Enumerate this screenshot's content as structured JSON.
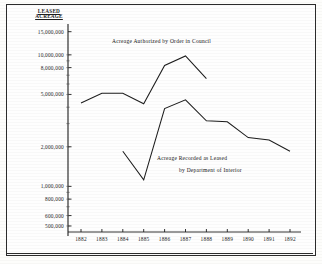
{
  "figure": {
    "background_color": "#fdfdfb",
    "ink_color": "#1d1d1d",
    "y_axis_title_line1": "LEASED",
    "y_axis_title_line2": "ACREAGE"
  },
  "annotations": {
    "series1_label": "Acreage Authorized by Order in Council",
    "series2_label_line1": "Acreage Recorded as Leased",
    "series2_label_line2": "by Department of Interior"
  },
  "chart_data": {
    "type": "line",
    "title": "",
    "subtitle": "",
    "xlabel": "",
    "ylabel": "LEASED ACREAGE",
    "yscale": "log",
    "ylim": [
      450000,
      16000000
    ],
    "grid": false,
    "legend_position": "inline-annotation",
    "categories": [
      "1882",
      "1883",
      "1884",
      "1885",
      "1886",
      "1887",
      "1888",
      "1889",
      "1890",
      "1891",
      "1892"
    ],
    "x": [
      1882,
      1883,
      1884,
      1885,
      1886,
      1887,
      1888,
      1889,
      1890,
      1891,
      1892
    ],
    "ytick_labels": [
      "15,000,000",
      "10,000,000",
      "8,000,000",
      "5,000,000",
      "2,000,000",
      "1,000,000",
      "800,000",
      "600,000",
      "500,000"
    ],
    "ytick_values": [
      15000000,
      10000000,
      8000000,
      5000000,
      2000000,
      1000000,
      800000,
      600000,
      500000
    ],
    "xtick_labels": [
      "1882",
      "1883",
      "1884",
      "1885",
      "1886",
      "1887",
      "1888",
      "1889",
      "1890",
      "1891",
      "1892"
    ],
    "series": [
      {
        "name": "Acreage Authorized by Order in Council",
        "x": [
          1882,
          1883,
          1884,
          1885,
          1886,
          1887,
          1888
        ],
        "values": [
          4300000,
          5100000,
          5100000,
          4250000,
          8300000,
          9800000,
          6600000
        ]
      },
      {
        "name": "Acreage Recorded as Leased by Department of Interior",
        "x": [
          1884,
          1885,
          1886,
          1887,
          1888,
          1889,
          1890,
          1891,
          1892
        ],
        "values": [
          1850000,
          1120000,
          3900000,
          4550000,
          3150000,
          3100000,
          2350000,
          2250000,
          1850000
        ]
      }
    ]
  }
}
